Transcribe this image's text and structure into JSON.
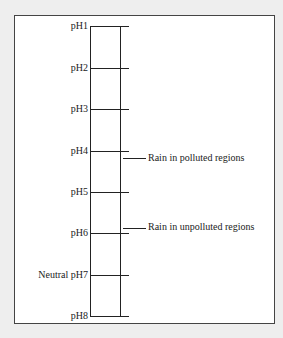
{
  "diagram": {
    "title": "",
    "scale": [
      {
        "label": "pH1",
        "value": 1
      },
      {
        "label": "pH2",
        "value": 2
      },
      {
        "label": "pH3",
        "value": 3
      },
      {
        "label": "pH4",
        "value": 4
      },
      {
        "label": "pH5",
        "value": 5
      },
      {
        "label": "pH6",
        "value": 6
      },
      {
        "label": "Neutral pH7",
        "value": 7
      },
      {
        "label": "pH8",
        "value": 8
      }
    ],
    "markers": [
      {
        "label": "Rain in polluted regions",
        "value": 4.2
      },
      {
        "label": "Rain in unpolluted regions",
        "value": 5.6
      }
    ]
  }
}
